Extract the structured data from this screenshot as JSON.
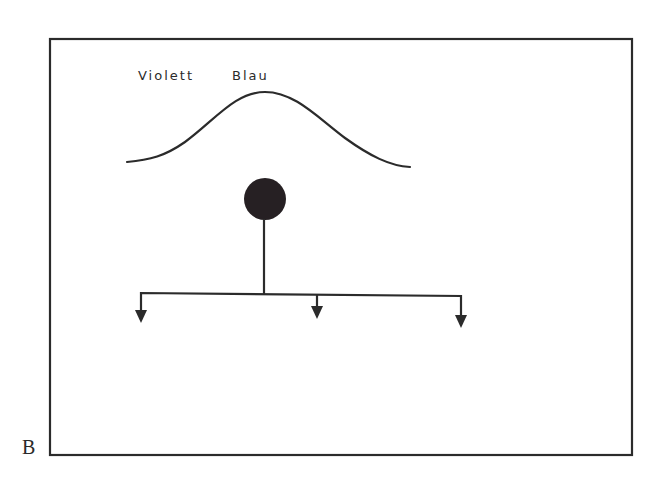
{
  "figure": {
    "panel_letter": "B",
    "spectrum_labels": {
      "left": "Violett",
      "right": "Blau"
    },
    "colors": {
      "ink": "#2b2b2b",
      "dot": "#262023",
      "background": "#ffffff"
    },
    "elements": {
      "frame": "rectangular-border",
      "curve": "bell-shaped-spectrum-curve",
      "source": "filled-circle-node",
      "branches": [
        "left-branch-arrow",
        "middle-branch-arrow",
        "right-branch-arrow"
      ]
    }
  }
}
